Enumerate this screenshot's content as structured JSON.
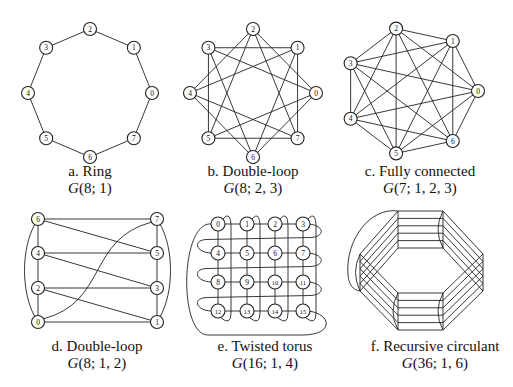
{
  "panels": [
    {
      "id": "a",
      "title": "a. Ring",
      "notation_letter": "G",
      "notation_args": "(8; 1)",
      "n": 8,
      "jumps": [
        1
      ],
      "layout": "circle",
      "node_labels": [
        "0",
        "1",
        "2",
        "3",
        "4",
        "5",
        "6",
        "7"
      ]
    },
    {
      "id": "b",
      "title": "b. Double-loop",
      "notation_letter": "G",
      "notation_args": "(8; 2, 3)",
      "n": 8,
      "jumps": [
        2,
        3
      ],
      "layout": "circle",
      "node_labels": [
        "0",
        "1",
        "2",
        "3",
        "4",
        "5",
        "6",
        "7"
      ]
    },
    {
      "id": "c",
      "title": "c. Fully connected",
      "notation_letter": "G",
      "notation_args": "(7; 1, 2, 3)",
      "n": 7,
      "jumps": [
        1,
        2,
        3
      ],
      "layout": "circle",
      "node_labels": [
        "0",
        "1",
        "2",
        "3",
        "4",
        "5",
        "6"
      ]
    },
    {
      "id": "d",
      "title": "d. Double-loop",
      "notation_letter": "G",
      "notation_args": "(8; 1, 2)",
      "n": 8,
      "jumps": [
        1,
        2
      ],
      "layout": "two-column",
      "node_labels": [
        "0",
        "1",
        "2",
        "3",
        "4",
        "5",
        "6",
        "7"
      ]
    },
    {
      "id": "e",
      "title": "e. Twisted torus",
      "notation_letter": "G",
      "notation_args": "(16; 1, 4)",
      "n": 16,
      "jumps": [
        1,
        4
      ],
      "layout": "grid-4x4",
      "node_labels": [
        "0",
        "1",
        "2",
        "3",
        "4",
        "5",
        "6",
        "7",
        "8",
        "9",
        "10",
        "11",
        "12",
        "13",
        "14",
        "15"
      ]
    },
    {
      "id": "f",
      "title": "f. Recursive circulant",
      "notation_letter": "G",
      "notation_args": "(36; 1, 6)",
      "n": 36,
      "jumps": [
        1,
        6
      ],
      "layout": "octagon-bundles",
      "node_labels": []
    }
  ]
}
